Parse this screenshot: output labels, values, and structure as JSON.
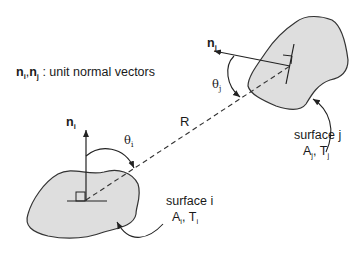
{
  "legend": {
    "n1": "n",
    "n1_sub": "i",
    "sep": ",",
    "n2": "n",
    "n2_sub": "j",
    "desc": " : unit normal vectors"
  },
  "surface_i": {
    "normal_label": "n",
    "normal_sub": "i",
    "angle_label": "θ",
    "angle_sub": "i",
    "name": "surface i",
    "props_A": "A",
    "props_A_sub": "i",
    "props_sep": ", T",
    "props_T_sub": "i"
  },
  "surface_j": {
    "normal_label": "n",
    "normal_sub": "j",
    "angle_label": "θ",
    "angle_sub": "j",
    "name": "surface j",
    "props_A": "A",
    "props_A_sub": "j",
    "props_sep": ", T",
    "props_T_sub": "j"
  },
  "distance_label": "R",
  "colors": {
    "fill": "#dedede",
    "stroke": "#333333",
    "text": "#1a1a1a"
  }
}
